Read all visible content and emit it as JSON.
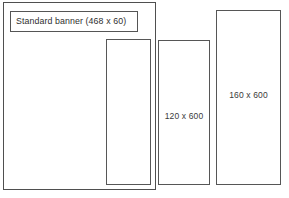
{
  "diagram": {
    "background_color": "#ffffff",
    "border_color": "#565656",
    "text_color": "#3a3a3a",
    "outer_container": {
      "name": "page-area-container",
      "label": ""
    },
    "boxes": [
      {
        "id": "standard-banner",
        "label": "Standard banner (468 x 60)",
        "width_px": 468,
        "height_px": 60
      },
      {
        "id": "inner-skyscraper",
        "label": "",
        "width_px": 120,
        "height_px": 600
      },
      {
        "id": "skyscraper-120",
        "label": "120 x 600",
        "width_px": 120,
        "height_px": 600
      },
      {
        "id": "skyscraper-160",
        "label": "160 x 600",
        "width_px": 160,
        "height_px": 600
      }
    ]
  }
}
